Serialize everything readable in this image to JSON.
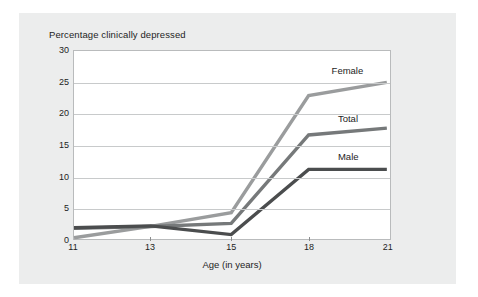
{
  "chart_data": {
    "type": "line",
    "title": "Percentage clinically depressed",
    "xlabel": "Age (in years)",
    "ylabel": "",
    "x": [
      11,
      13,
      15,
      18,
      21
    ],
    "categories": [
      "11",
      "13",
      "15",
      "18",
      "21"
    ],
    "xticklabels": [
      "11",
      "13",
      "15",
      "18",
      "21"
    ],
    "yticklabels": [
      "0",
      "5",
      "10",
      "15",
      "20",
      "25",
      "30"
    ],
    "yticks": [
      0,
      5,
      10,
      15,
      20,
      25,
      30
    ],
    "ylim": [
      0,
      30
    ],
    "xlim": [
      11,
      21
    ],
    "grid": true,
    "legend_position": "inline-right",
    "series": [
      {
        "name": "Female",
        "color": "#9a9c9d",
        "values": [
          0.2,
          2.0,
          4.2,
          22.9,
          25.0
        ],
        "label_text": "Female"
      },
      {
        "name": "Total",
        "color": "#76797a",
        "values": [
          1.7,
          2.0,
          2.5,
          16.6,
          17.7
        ],
        "label_text": "Total"
      },
      {
        "name": "Male",
        "color": "#4b4d4e",
        "values": [
          1.8,
          2.1,
          0.7,
          11.1,
          11.1
        ],
        "label_text": "Male"
      }
    ],
    "annotations": [
      {
        "text": "Female",
        "x": 19.1,
        "y": 26.9
      },
      {
        "text": "Total",
        "x": 19.3,
        "y": 19.2
      },
      {
        "text": "Male",
        "x": 19.3,
        "y": 13.2
      }
    ]
  },
  "colors": {
    "card_background": "#eceded",
    "plot_background": "#ffffff",
    "plot_border": "#b9bbbc",
    "gridline": "#c8cacb",
    "text": "#1d1d1d"
  }
}
